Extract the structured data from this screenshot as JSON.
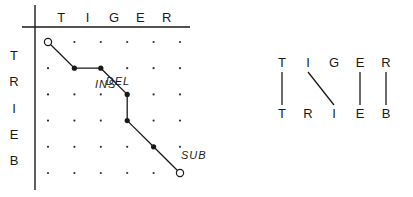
{
  "edit_grid": {
    "columns": [
      "T",
      "I",
      "G",
      "E",
      "R"
    ],
    "rows": [
      "T",
      "R",
      "I",
      "E",
      "B"
    ],
    "path": [
      [
        0,
        0
      ],
      [
        1,
        1
      ],
      [
        2,
        1
      ],
      [
        3,
        2
      ],
      [
        3,
        3
      ],
      [
        4,
        4
      ],
      [
        5,
        5
      ]
    ],
    "open_nodes": [
      [
        0,
        0
      ],
      [
        5,
        5
      ]
    ],
    "operations": [
      {
        "label": "DEL",
        "at": [
          2,
          1
        ]
      },
      {
        "label": "INS",
        "at": [
          3,
          2.5
        ]
      },
      {
        "label": "SUB",
        "at": [
          5,
          4.5
        ]
      }
    ]
  },
  "alignment": {
    "top": [
      "T",
      "I",
      "G",
      "E",
      "R"
    ],
    "bottom": [
      "T",
      "R",
      "I",
      "E",
      "B"
    ],
    "links": [
      [
        0,
        0
      ],
      [
        1,
        2
      ],
      [
        3,
        3
      ],
      [
        4,
        4
      ]
    ]
  }
}
